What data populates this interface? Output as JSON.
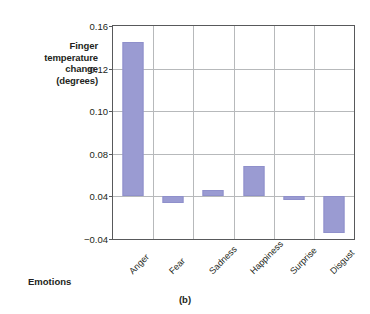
{
  "chart_data": {
    "type": "bar",
    "title": "",
    "caption": "(b)",
    "xlabel": "Emotions",
    "ylabel": "Finger temperature change (degrees)",
    "ylabel_lines": [
      "Finger",
      "temperature",
      "change",
      "(degrees)"
    ],
    "categories": [
      "Anger",
      "Fear",
      "Sadness",
      "Happiness",
      "Surprise",
      "Disgust"
    ],
    "values": [
      0.145,
      0.028,
      0.046,
      0.069,
      0.034,
      -0.029
    ],
    "baseline": 0.04,
    "ytick_labels": [
      "0.16",
      "0.12",
      "0.10",
      "0.08",
      "0.04",
      "-0.04"
    ],
    "ytick_values": [
      0.16,
      0.12,
      0.1,
      0.08,
      0.04,
      -0.04
    ],
    "ylim": [
      -0.04,
      0.16
    ],
    "grid": "both",
    "legend": "none",
    "bar_color": "#9a9bd2",
    "axis_color": "#58595b",
    "grid_color": "#b7b9bb"
  }
}
